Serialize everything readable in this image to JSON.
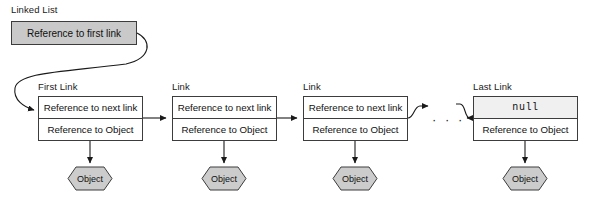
{
  "diagram": {
    "title": "Linked List",
    "head_reference": {
      "label": "Reference to first link"
    },
    "ellipsis": "· · ·",
    "nodes": [
      {
        "caption": "First Link",
        "next_label": "Reference to next link",
        "data_label": "Reference to Object",
        "object_label": "Object"
      },
      {
        "caption": "Link",
        "next_label": "Reference to next link",
        "data_label": "Reference to Object",
        "object_label": "Object"
      },
      {
        "caption": "Link",
        "next_label": "Reference to next link",
        "data_label": "Reference to Object",
        "object_label": "Object"
      },
      {
        "caption": "Last Link",
        "next_label": "null",
        "data_label": "Reference to Object",
        "object_label": "Object"
      }
    ],
    "colors": {
      "head_fill": "#c9c9c9",
      "node_fill": "#ffffff",
      "null_fill": "#f0f0f0",
      "object_fill": "#cccccc",
      "stroke": "#3c3c3c",
      "text": "#101010",
      "background": "#ffffff"
    }
  }
}
